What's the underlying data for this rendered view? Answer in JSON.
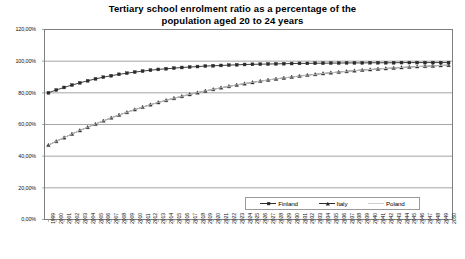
{
  "chart_data": {
    "type": "line",
    "title": "Tertiary school enrolment ratio as a percentage of the population aged 20 to 24 years",
    "title_line1": "Tertiary school enrolment ratio as a percentage of the",
    "title_line2": "population aged 20 to 24 years",
    "xlabel": "",
    "ylabel": "",
    "grid": true,
    "legend_position": "bottom-right",
    "ylim": [
      0,
      120
    ],
    "ytick_labels": [
      "120,00%",
      "100,00%",
      "80,00%",
      "60,00%",
      "40,00%",
      "20,00%",
      "0,00%"
    ],
    "ytick_values": [
      120,
      100,
      80,
      60,
      40,
      20,
      0
    ],
    "x": [
      1999,
      2000,
      2001,
      2002,
      2003,
      2004,
      2005,
      2006,
      2007,
      2008,
      2009,
      2010,
      2011,
      2012,
      2013,
      2014,
      2015,
      2016,
      2017,
      2018,
      2019,
      2020,
      2021,
      2022,
      2023,
      2024,
      2025,
      2026,
      2027,
      2028,
      2029,
      2030,
      2031,
      2032,
      2033,
      2034,
      2035,
      2036,
      2037,
      2038,
      2039,
      2040,
      2041,
      2042,
      2043,
      2044,
      2045,
      2046,
      2047,
      2048,
      2049,
      2050
    ],
    "xtick_labels": [
      "1999",
      "2000",
      "2001",
      "2002",
      "2003",
      "2004",
      "2005",
      "2006",
      "2007",
      "2008",
      "2009",
      "2010",
      "2011",
      "2012",
      "2013",
      "2014",
      "2015",
      "2016",
      "2017",
      "2018",
      "2019",
      "2020",
      "2021",
      "2022",
      "2023",
      "2024",
      "2025",
      "2026",
      "2027",
      "2028",
      "2029",
      "2030",
      "2031",
      "2032",
      "2033",
      "2034",
      "2035",
      "2036",
      "2037",
      "2038",
      "2039",
      "2040",
      "2041",
      "2042",
      "2043",
      "2044",
      "2045",
      "2046",
      "2047",
      "2048",
      "2049",
      "2050"
    ],
    "series": [
      {
        "name": "Finland",
        "marker": "square",
        "color": "#2b2b2b",
        "values": [
          80.0,
          81.8,
          83.4,
          84.9,
          86.3,
          87.6,
          88.8,
          89.9,
          90.8,
          91.7,
          92.4,
          93.1,
          93.7,
          94.3,
          94.8,
          95.2,
          95.6,
          96.0,
          96.3,
          96.6,
          96.9,
          97.1,
          97.3,
          97.5,
          97.7,
          97.9,
          98.0,
          98.1,
          98.2,
          98.3,
          98.4,
          98.5,
          98.6,
          98.6,
          98.7,
          98.7,
          98.8,
          98.8,
          98.9,
          98.9,
          98.9,
          99.0,
          99.0,
          99.0,
          99.0,
          99.1,
          99.1,
          99.1,
          99.1,
          99.1,
          99.1,
          99.1
        ]
      },
      {
        "name": "Italy",
        "marker": "triangle",
        "color": "#2b2b2b",
        "values": [
          47.0,
          49.4,
          51.7,
          54.0,
          56.2,
          58.3,
          60.3,
          62.3,
          64.2,
          66.0,
          67.7,
          69.4,
          71.0,
          72.5,
          73.9,
          75.3,
          76.6,
          77.8,
          79.0,
          80.1,
          81.2,
          82.2,
          83.2,
          84.1,
          85.0,
          85.8,
          86.6,
          87.4,
          88.1,
          88.8,
          89.4,
          90.0,
          90.6,
          91.2,
          91.7,
          92.2,
          92.7,
          93.1,
          93.6,
          94.0,
          94.4,
          94.7,
          95.1,
          95.4,
          95.7,
          96.0,
          96.3,
          96.6,
          96.8,
          97.0,
          97.3,
          97.5
        ]
      },
      {
        "name": "Poland",
        "marker": "none",
        "color": "#cfcfcf",
        "values": [
          47.0,
          49.4,
          51.7,
          54.0,
          56.2,
          58.3,
          60.3,
          62.3,
          64.2,
          66.0,
          67.7,
          69.4,
          71.0,
          72.5,
          73.9,
          75.3,
          76.6,
          77.8,
          79.0,
          80.1,
          81.2,
          82.2,
          83.2,
          84.1,
          85.0,
          85.8,
          86.6,
          87.4,
          88.1,
          88.8,
          89.4,
          90.0,
          90.6,
          91.2,
          91.7,
          92.2,
          92.7,
          93.1,
          93.6,
          94.0,
          94.4,
          94.7,
          95.1,
          95.4,
          95.7,
          96.0,
          96.3,
          96.6,
          96.8,
          97.0,
          97.3,
          97.5
        ]
      }
    ]
  },
  "legend": {
    "items": [
      {
        "label": "Finland",
        "marker": "square-marker",
        "color": "#2b2b2b"
      },
      {
        "label": "Italy",
        "marker": "triangle-marker",
        "color": "#2b2b2b"
      },
      {
        "label": "Poland",
        "marker": "none-marker",
        "color": "#cfcfcf"
      }
    ]
  },
  "colors": {
    "axis": "#7f7f7f",
    "grid": "#808080",
    "plot_background": "#ffffff",
    "finland": "#2b2b2b",
    "italy": "#2b2b2b",
    "poland": "#cfcfcf"
  }
}
